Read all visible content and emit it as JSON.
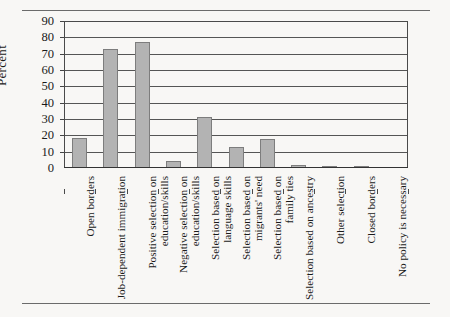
{
  "chart_data": {
    "type": "bar",
    "title": "",
    "xlabel": "",
    "ylabel": "Percent",
    "ylim": [
      0,
      90
    ],
    "ytick_step": 10,
    "yticks": [
      0,
      10,
      20,
      30,
      40,
      50,
      60,
      70,
      80,
      90
    ],
    "grid": true,
    "legend": "none",
    "bar_fill_color": "#b3b3b3",
    "bar_border_color": "#7d7d7d",
    "categories": [
      "Open borders",
      "Job-dependent immigration",
      "Positive selection on education/skills",
      "Negative selection on education/skills",
      "Selection based on language skills",
      "Selection based on migrants' need",
      "Selection based on family ties",
      "Selection based on ancestry",
      "Other selection",
      "Closed borders",
      "No policy is necessary"
    ],
    "category_lines": [
      [
        "Open borders"
      ],
      [
        "Job-dependent immigration"
      ],
      [
        "Positive selection on",
        "education/skills"
      ],
      [
        "Negative selection on",
        "education/skills"
      ],
      [
        "Selection based on",
        "language skills"
      ],
      [
        "Selection based on",
        "migrants' need"
      ],
      [
        "Selection based on",
        "family ties"
      ],
      [
        "Selection based on ancestry"
      ],
      [
        "Other selection"
      ],
      [
        "Closed borders"
      ],
      [
        "No policy is necessary"
      ]
    ],
    "values": [
      18.5,
      73,
      77,
      4.5,
      31,
      13,
      18,
      2,
      1,
      1.5,
      0
    ]
  }
}
